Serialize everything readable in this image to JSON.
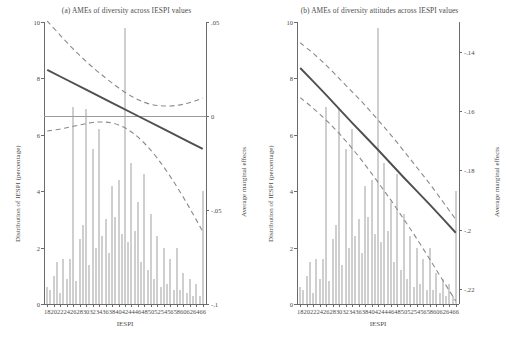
{
  "figure": {
    "panels": [
      {
        "id": "a",
        "title": "(a) AMEs of diversity across IESPI values",
        "xlabel": "IESPI",
        "ylabel_left": "Distribution of IESPI (percentage)",
        "ylabel_right": "Average marginal effects",
        "left_ticks": [
          "0",
          "2",
          "4",
          "6",
          "8",
          "10"
        ],
        "right_ticks": [
          "-.1",
          "-.05",
          "0",
          ".05"
        ],
        "x_ticks": [
          "18",
          "20",
          "22",
          "24",
          "26",
          "28",
          "30",
          "32",
          "34",
          "36",
          "38",
          "40",
          "42",
          "44",
          "46",
          "48",
          "50",
          "52",
          "54",
          "56",
          "58",
          "60",
          "62",
          "64",
          "66"
        ]
      },
      {
        "id": "b",
        "title": "(b) AMEs of diversity attitudes across IESPI values",
        "xlabel": "IESPI",
        "ylabel_left": "Distribution of IESPI (percentage)",
        "ylabel_right": "Average marginal effects",
        "left_ticks": [
          "0",
          "2",
          "4",
          "6",
          "8",
          "10"
        ],
        "right_ticks": [
          "-.22",
          "-.2",
          "-.18",
          "-.16",
          "-.14"
        ],
        "x_ticks": [
          "18",
          "20",
          "22",
          "24",
          "26",
          "28",
          "30",
          "32",
          "34",
          "36",
          "38",
          "40",
          "42",
          "44",
          "46",
          "48",
          "50",
          "52",
          "54",
          "56",
          "58",
          "60",
          "62",
          "64",
          "66"
        ]
      }
    ]
  },
  "chart_data": [
    {
      "type": "line",
      "panel": "a",
      "title": "(a) AMEs of diversity across IESPI values",
      "xlabel": "IESPI",
      "ylabel": "Average marginal effects",
      "ylabel_secondary": "Distribution of IESPI (percentage)",
      "xlim": [
        17,
        67
      ],
      "ylim_right": [
        -0.1,
        0.05
      ],
      "ylim_left": [
        0,
        10
      ],
      "grid": false,
      "legend": "none",
      "series": [
        {
          "name": "AME estimate",
          "style": "solid",
          "x": [
            18,
            26,
            34,
            42,
            50,
            58,
            66
          ],
          "values": [
            0.0245,
            0.0175,
            0.0105,
            0.0035,
            -0.0035,
            -0.0105,
            -0.0175
          ]
        },
        {
          "name": "Upper 95% CI",
          "style": "dashed",
          "x": [
            18,
            22,
            26,
            30,
            34,
            38,
            42,
            46,
            50,
            54,
            58,
            62,
            66
          ],
          "values": [
            0.0505,
            0.043,
            0.0355,
            0.029,
            0.023,
            0.0175,
            0.0125,
            0.0085,
            0.006,
            0.0052,
            0.0055,
            0.007,
            0.0095
          ]
        },
        {
          "name": "Lower 95% CI",
          "style": "dashed",
          "x": [
            18,
            22,
            26,
            30,
            34,
            38,
            42,
            46,
            50,
            54,
            58,
            62,
            66
          ],
          "values": [
            -0.008,
            -0.007,
            -0.0055,
            -0.004,
            -0.003,
            -0.0035,
            -0.006,
            -0.011,
            -0.018,
            -0.027,
            -0.0375,
            -0.049,
            -0.0615
          ]
        }
      ],
      "histogram": {
        "name": "Distribution of IESPI (percentage)",
        "x": [
          18,
          19,
          20,
          21,
          22,
          23,
          24,
          25,
          26,
          27,
          28,
          29,
          30,
          31,
          32,
          33,
          34,
          35,
          36,
          37,
          38,
          39,
          40,
          41,
          42,
          43,
          44,
          45,
          46,
          47,
          48,
          49,
          50,
          51,
          52,
          53,
          54,
          55,
          56,
          57,
          58,
          59,
          60,
          61,
          62,
          63,
          64,
          65,
          66
        ],
        "values": [
          0.6,
          0.5,
          1.0,
          1.5,
          0.4,
          1.6,
          0.9,
          1.6,
          7.0,
          0.8,
          2.3,
          2.8,
          6.9,
          1.4,
          5.5,
          2.0,
          6.2,
          2.4,
          3.0,
          1.8,
          4.2,
          3.1,
          4.4,
          2.5,
          9.8,
          2.2,
          5.0,
          2.6,
          3.6,
          1.5,
          4.6,
          1.2,
          3.2,
          0.9,
          2.4,
          0.6,
          2.0,
          0.7,
          1.6,
          0.5,
          2.0,
          0.5,
          1.1,
          0.4,
          0.9,
          0.3,
          0.7,
          0.3,
          4.0
        ]
      }
    },
    {
      "type": "line",
      "panel": "b",
      "title": "(b) AMEs of diversity attitudes across IESPI values",
      "xlabel": "IESPI",
      "ylabel": "Average marginal effects",
      "ylabel_secondary": "Distribution of IESPI (percentage)",
      "xlim": [
        17,
        67
      ],
      "ylim_right": [
        -0.225,
        -0.13
      ],
      "ylim_left": [
        0,
        10
      ],
      "grid": false,
      "legend": "none",
      "series": [
        {
          "name": "AME estimate",
          "style": "solid",
          "x": [
            18,
            26,
            34,
            42,
            50,
            58,
            66
          ],
          "values": [
            -0.1455,
            -0.1545,
            -0.164,
            -0.173,
            -0.1825,
            -0.1915,
            -0.201
          ]
        },
        {
          "name": "Upper 95% CI",
          "style": "dashed",
          "x": [
            18,
            22,
            26,
            30,
            34,
            38,
            42,
            46,
            50,
            54,
            58,
            62,
            66
          ],
          "values": [
            -0.137,
            -0.1405,
            -0.1445,
            -0.149,
            -0.1535,
            -0.158,
            -0.163,
            -0.168,
            -0.1735,
            -0.179,
            -0.1845,
            -0.1905,
            -0.1965
          ]
        },
        {
          "name": "Lower 95% CI",
          "style": "dashed",
          "x": [
            18,
            22,
            26,
            30,
            34,
            38,
            42,
            46,
            50,
            54,
            58,
            62,
            66
          ],
          "values": [
            -0.1555,
            -0.159,
            -0.163,
            -0.1675,
            -0.1725,
            -0.178,
            -0.184,
            -0.19,
            -0.1965,
            -0.203,
            -0.21,
            -0.217,
            -0.224
          ]
        }
      ],
      "histogram": {
        "name": "Distribution of IESPI (percentage)",
        "x": [
          18,
          19,
          20,
          21,
          22,
          23,
          24,
          25,
          26,
          27,
          28,
          29,
          30,
          31,
          32,
          33,
          34,
          35,
          36,
          37,
          38,
          39,
          40,
          41,
          42,
          43,
          44,
          45,
          46,
          47,
          48,
          49,
          50,
          51,
          52,
          53,
          54,
          55,
          56,
          57,
          58,
          59,
          60,
          61,
          62,
          63,
          64,
          65,
          66
        ],
        "values": [
          0.6,
          0.5,
          1.0,
          1.5,
          0.4,
          1.6,
          0.9,
          1.6,
          7.0,
          0.8,
          2.3,
          2.8,
          6.9,
          1.4,
          5.5,
          2.0,
          6.2,
          2.4,
          3.0,
          1.8,
          4.2,
          3.1,
          4.4,
          2.5,
          9.8,
          2.2,
          5.0,
          2.6,
          3.6,
          1.5,
          4.6,
          1.2,
          3.2,
          0.9,
          2.4,
          0.6,
          2.0,
          0.7,
          1.6,
          0.5,
          2.0,
          0.5,
          1.1,
          0.4,
          0.9,
          0.3,
          0.7,
          0.3,
          4.0
        ]
      }
    }
  ]
}
